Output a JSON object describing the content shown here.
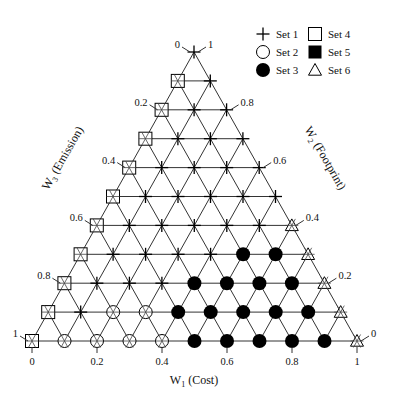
{
  "chart_data": {
    "type": "ternary-scatter",
    "title": "",
    "axes": {
      "w1": {
        "label": "W",
        "sub": "1",
        "name": "(Cost)",
        "ticks": [
          "0",
          "0.2",
          "0.4",
          "0.6",
          "0.8",
          "1"
        ]
      },
      "w2": {
        "label": "W",
        "sub": "2",
        "name": "(Footprint)",
        "ticks": [
          "0",
          "0.2",
          "0.4",
          "0.6",
          "0.8",
          "1"
        ]
      },
      "w3": {
        "label": "W",
        "sub": "3",
        "name": "(Emission)",
        "ticks": [
          "0",
          "0.2",
          "0.4",
          "0.6",
          "0.8",
          "1"
        ]
      }
    },
    "grid_step": 0.1,
    "legend": [
      {
        "key": "set1",
        "label": "Set 1",
        "marker": "plus"
      },
      {
        "key": "set2",
        "label": "Set 2",
        "marker": "open-circle"
      },
      {
        "key": "set3",
        "label": "Set 3",
        "marker": "filled-circle"
      },
      {
        "key": "set4",
        "label": "Set 4",
        "marker": "open-square"
      },
      {
        "key": "set5",
        "label": "Set 5",
        "marker": "filled-square"
      },
      {
        "key": "set6",
        "label": "Set 6",
        "marker": "open-triangle"
      }
    ],
    "rows_top_to_bottom": [
      [
        "set1"
      ],
      [
        "set4",
        "set1"
      ],
      [
        "set4",
        "set1",
        "set1"
      ],
      [
        "set4",
        "set1",
        "set1",
        "set1"
      ],
      [
        "set4",
        "set1",
        "set1",
        "set1",
        "set1"
      ],
      [
        "set4",
        "set1",
        "set1",
        "set1",
        "set1",
        "set1"
      ],
      [
        "set4",
        "set1",
        "set1",
        "set1",
        "set1",
        "set1",
        "set6"
      ],
      [
        "set4",
        "set1",
        "set1",
        "set1",
        "set1",
        "set3",
        "set3",
        "set6"
      ],
      [
        "set4",
        "set1",
        "set1",
        "set1",
        "set3",
        "set3",
        "set3",
        "set3",
        "set6"
      ],
      [
        "set4",
        "set1",
        "set2",
        "set2",
        "set3",
        "set3",
        "set3",
        "set3",
        "set3",
        "set6"
      ],
      [
        "set4",
        "set2",
        "set2",
        "set2",
        "set2",
        "set3",
        "set3",
        "set3",
        "set3",
        "set3",
        "set6"
      ]
    ],
    "row_note": "Row j (0=apex..10=base) has W3 = j/10; position i within row gives W1 = i/10; W2 = 1 - W1 - W3"
  }
}
